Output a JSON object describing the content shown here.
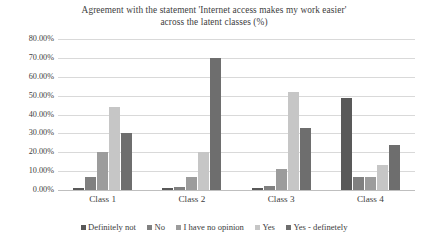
{
  "chart_data": {
    "type": "bar",
    "title": "Agreement with the statement 'Internet access makes my work easier' across the latent classes (%)",
    "title_lines": [
      "Agreement with the statement 'Internet access makes my work easier'",
      "across the latent classes (%)"
    ],
    "xlabel": "",
    "ylabel": "",
    "ylim": [
      0,
      80
    ],
    "grid": true,
    "legend_position": "bottom",
    "categories": [
      "Class 1",
      "Class 2",
      "Class 3",
      "Class 4"
    ],
    "ytick_labels": [
      "0.00%",
      "10.00%",
      "20.00%",
      "30.00%",
      "40.00%",
      "50.00%",
      "60.00%",
      "70.00%",
      "80.00%"
    ],
    "ytick_values": [
      0,
      10,
      20,
      30,
      40,
      50,
      60,
      70,
      80
    ],
    "series": [
      {
        "name": "Definitely not",
        "color": "#595959",
        "values": [
          1,
          1,
          1,
          49
        ]
      },
      {
        "name": "No",
        "color": "#808080",
        "values": [
          7,
          1.5,
          2,
          7
        ]
      },
      {
        "name": "I have no opinion",
        "color": "#9c9c9c",
        "values": [
          20,
          7,
          11,
          7
        ]
      },
      {
        "name": "Yes",
        "color": "#c6c6c6",
        "values": [
          44,
          20,
          52,
          13
        ]
      },
      {
        "name": "Yes - definetely",
        "color": "#6e6e6e",
        "values": [
          30,
          70,
          33,
          24
        ]
      }
    ]
  }
}
